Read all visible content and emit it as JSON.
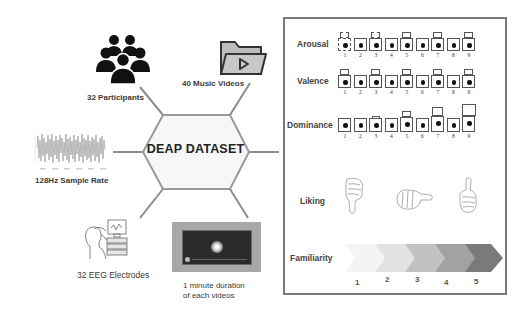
{
  "center": {
    "title": "DEAP DATASET"
  },
  "nodes": {
    "participants": {
      "label": "32 Participants",
      "icon": "people-group-icon"
    },
    "music_videos": {
      "label": "40 Music Videos",
      "icon": "video-folder-icon"
    },
    "sample_rate": {
      "label": "128Hz Sample Rate",
      "icon": "eeg-signal-waveform-icon"
    },
    "electrodes": {
      "label": "32 EEG Electrodes",
      "icon": "eeg-recording-person-icon"
    },
    "duration": {
      "line1": "1 minute duration",
      "line2": "of each videos",
      "icon": "video-player-icon"
    }
  },
  "panel": {
    "rows": [
      {
        "label": "Arousal",
        "scale": [
          "1",
          "2",
          "3",
          "4",
          "5",
          "6",
          "7",
          "8",
          "9"
        ]
      },
      {
        "label": "Valence",
        "scale": [
          "1",
          "2",
          "3",
          "4",
          "5",
          "6",
          "7",
          "8",
          "9"
        ]
      },
      {
        "label": "Dominance",
        "scale": [
          "1",
          "2",
          "3",
          "4",
          "5",
          "6",
          "7",
          "8",
          "9"
        ]
      },
      {
        "label": "Liking",
        "icons": [
          "thumbs-down-icon",
          "thumbs-sideways-icon",
          "thumbs-up-icon"
        ]
      },
      {
        "label": "Familiarity",
        "scale": [
          "1",
          "2",
          "3",
          "4",
          "5"
        ]
      }
    ],
    "familiarity_colors": [
      "#f4f4f4",
      "#e2e2e2",
      "#c2c2c2",
      "#a2a2a2",
      "#7a7a7a"
    ]
  },
  "colors": {
    "connector": "#8c8c8c",
    "hex_border": "#9a9a9a",
    "hex_fill": "#f7f7f7",
    "panel_border": "#7a7a7a"
  }
}
